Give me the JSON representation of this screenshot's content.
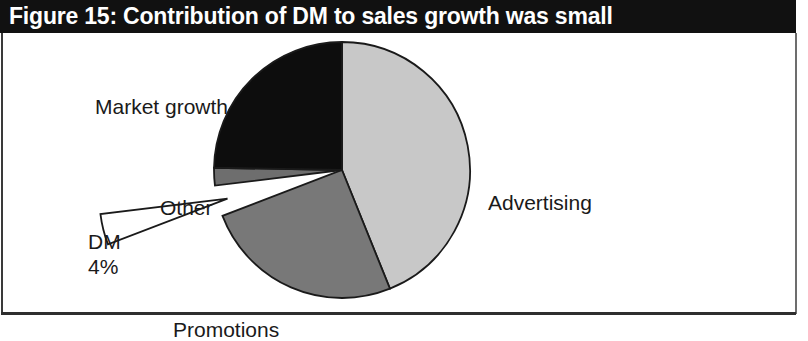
{
  "figure": {
    "title": "Figure 15: Contribution of DM to sales growth was small",
    "title_bar_color": "#111111",
    "title_text_color": "#ffffff",
    "background_color": "#ffffff"
  },
  "labels": {
    "market_growth": "Market growth",
    "advertising": "Advertising",
    "promotions": "Promotions",
    "other": "Other",
    "dm": "DM",
    "dm_value": "4%"
  },
  "chart_data": {
    "type": "pie",
    "title": "Figure 15: Contribution of DM to sales growth was small",
    "xlabel": "",
    "ylabel": "",
    "legend_position": "none",
    "grid": false,
    "start_angle_deg": 0,
    "direction": "clockwise",
    "center": {
      "cx": 342,
      "cy": 137
    },
    "radius": 128,
    "labels": [
      "Advertising",
      "Promotions",
      "DM",
      "Other",
      "Market growth"
    ],
    "values": [
      44,
      25,
      4,
      2,
      25
    ],
    "data_labels": [
      "",
      "",
      "4%",
      "",
      ""
    ],
    "colors": [
      "#c8c8c8",
      "#787878",
      "#ffffff",
      "#6e6e6e",
      "#0d0d0d"
    ],
    "exploded": [
      false,
      false,
      true,
      false,
      false
    ],
    "slices": [
      {
        "name": "Advertising",
        "value": 44,
        "percent": "44%",
        "color": "#c8c8c8",
        "start_deg": 0,
        "end_deg": 158,
        "exploded": false,
        "label": "Advertising"
      },
      {
        "name": "Promotions",
        "value": 25,
        "percent": "25%",
        "color": "#787878",
        "start_deg": 158,
        "end_deg": 249,
        "exploded": false,
        "label": "Promotions"
      },
      {
        "name": "DM",
        "value": 4,
        "percent": "4%",
        "color": "#ffffff",
        "start_deg": 249,
        "end_deg": 263,
        "exploded": true,
        "label": "DM"
      },
      {
        "name": "Other",
        "value": 2,
        "percent": "2%",
        "color": "#6e6e6e",
        "start_deg": 263,
        "end_deg": 271,
        "exploded": false,
        "label": "Other"
      },
      {
        "name": "Market growth",
        "value": 25,
        "percent": "25%",
        "color": "#0d0d0d",
        "start_deg": 271,
        "end_deg": 360,
        "exploded": false,
        "label": "Market growth"
      }
    ]
  }
}
